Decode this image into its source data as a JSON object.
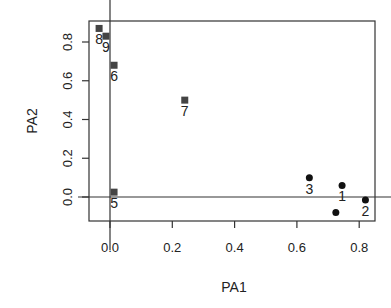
{
  "chart_data": {
    "type": "scatter",
    "title": "",
    "xlabel": "PA1",
    "ylabel": "PA2",
    "xlim": [
      -0.05,
      0.85
    ],
    "ylim": [
      -0.12,
      0.9
    ],
    "xticks": [
      0.0,
      0.2,
      0.4,
      0.6,
      0.8
    ],
    "xtick_labels": [
      "0.0",
      "0.2",
      "0.4",
      "0.6",
      "0.8"
    ],
    "yticks": [
      0.0,
      0.2,
      0.4,
      0.6,
      0.8
    ],
    "ytick_labels": [
      "0.0",
      "0.2",
      "0.4",
      "0.6",
      "0.8"
    ],
    "grid": false,
    "reference_lines": {
      "x": 0,
      "y": 0
    },
    "series": [
      {
        "name": "circles",
        "marker": "circle",
        "color": "#111111",
        "points": [
          {
            "label": "1",
            "x": 0.745,
            "y": 0.06
          },
          {
            "label": "2",
            "x": 0.82,
            "y": -0.015
          },
          {
            "label": "3",
            "x": 0.64,
            "y": 0.1
          },
          {
            "label": "",
            "x": 0.725,
            "y": -0.08
          }
        ]
      },
      {
        "name": "squares",
        "marker": "square",
        "color": "#444444",
        "points": [
          {
            "label": "5",
            "x": 0.013,
            "y": 0.025
          },
          {
            "label": "6",
            "x": 0.013,
            "y": 0.68
          },
          {
            "label": "7",
            "x": 0.24,
            "y": 0.5
          },
          {
            "label": "8",
            "x": -0.035,
            "y": 0.87
          },
          {
            "label": "9",
            "x": -0.013,
            "y": 0.83
          }
        ]
      }
    ]
  }
}
